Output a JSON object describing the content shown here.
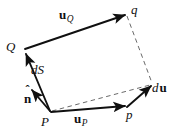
{
  "figure": {
    "width": 176,
    "height": 135,
    "background_color": "#ffffff",
    "stroke_color": "#101010",
    "dash_color": "#6a6a6a"
  },
  "labels": {
    "u_Q": {
      "base": "u",
      "subscript": "Q"
    },
    "q": {
      "text": "q"
    },
    "Q": {
      "text": "Q"
    },
    "dS": {
      "text": "dS"
    },
    "n_hat": {
      "base": "n",
      "accent": "ˆ"
    },
    "P": {
      "text": "P"
    },
    "u_P": {
      "base": "u",
      "subscript": "P"
    },
    "p": {
      "text": "p"
    },
    "du": {
      "prefix": "d",
      "base": "u"
    }
  },
  "geometry": {
    "vertices": {
      "P": [
        50,
        112
      ],
      "Q": [
        24,
        50
      ],
      "q": [
        127,
        14
      ],
      "p": [
        127,
        108
      ],
      "du_tip": [
        153,
        85
      ]
    },
    "solid_edges": [
      {
        "name": "P-to-Q",
        "from": "P",
        "to": "Q",
        "arrow": true,
        "label": "dS"
      },
      {
        "name": "Q-to-q",
        "from": "Q",
        "to": "q",
        "arrow": true,
        "label": "u_Q"
      },
      {
        "name": "P-to-p",
        "from": "P",
        "to": "p",
        "arrow": true,
        "label": "u_P"
      },
      {
        "name": "p-to-du",
        "from": "p",
        "to": "du_tip",
        "arrow": true,
        "label": "du"
      },
      {
        "name": "normal-at-P",
        "from": "P",
        "to": [
          30,
          88
        ],
        "arrow": true,
        "label": "n_hat"
      }
    ],
    "dashed_edges": [
      {
        "name": "q-to-du",
        "from": "q",
        "to": "du_tip"
      },
      {
        "name": "P-to-du",
        "from": "P",
        "to": "du_tip"
      }
    ]
  }
}
